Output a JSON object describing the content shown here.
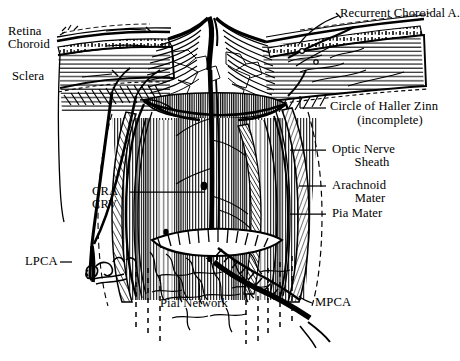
{
  "figure": {
    "style": "pen-and-ink anatomical illustration",
    "background_color": "#ffffff",
    "ink_color": "#000000",
    "signature": "artist signature (cursive monogram)"
  },
  "labels": {
    "retina": "Retina",
    "choroid": "Choroid",
    "sclera": "Sclera",
    "recurrent_choroidal_a": "Recurrent Choroidal A.",
    "circle_of_haller_zinn": "Circle of Haller Zinn",
    "circle_of_haller_zinn_note": "(incomplete)",
    "optic_nerve_sheath_l1": "Optic Nerve",
    "optic_nerve_sheath_l2": "Sheath",
    "arachnoid_mater_l1": "Arachnoid",
    "arachnoid_mater_l2": "Mater",
    "pia_mater": "Pia Mater",
    "cra": "CRA",
    "crv": "CRV",
    "lpca": "LPCA",
    "mpca": "MPCA",
    "pial_network": "Pial Network"
  },
  "structures": [
    {
      "name": "retina",
      "side": "left",
      "description": "inner neural layer at top of globe wall"
    },
    {
      "name": "choroid",
      "side": "left",
      "description": "vascular layer beneath retina"
    },
    {
      "name": "sclera",
      "side": "left",
      "description": "outer fibrous coat, horizontally striated"
    },
    {
      "name": "optic-nerve-head",
      "side": "center",
      "description": "optic disc with central cup"
    },
    {
      "name": "optic-nerve",
      "side": "center",
      "description": "vertically striated nerve trunk"
    },
    {
      "name": "optic-nerve-sheath",
      "side": "right",
      "description": "dural sheath investing the nerve"
    },
    {
      "name": "arachnoid-mater",
      "side": "right",
      "description": "middle meningeal layer"
    },
    {
      "name": "pia-mater",
      "side": "right",
      "description": "innermost meningeal layer"
    },
    {
      "name": "circle-of-haller-zinn",
      "side": "right",
      "description": "incomplete arterial circle around the nerve"
    },
    {
      "name": "recurrent-choroidal-artery",
      "side": "right",
      "description": "recurrent branch to choroid"
    },
    {
      "name": "central-retinal-artery-vein",
      "side": "center",
      "description": "CRA and CRV running in nerve axis"
    },
    {
      "name": "lateral-posterior-ciliary-artery",
      "side": "left",
      "description": "LPCA ascending at left"
    },
    {
      "name": "medial-posterior-ciliary-artery",
      "side": "right",
      "description": "MPCA entering at lower right"
    },
    {
      "name": "pial-network",
      "side": "center-bottom",
      "description": "reticular pial vascular plexus"
    }
  ],
  "leader_lines": [
    {
      "label": "retina",
      "from": [
        105,
        33
      ],
      "to": [
        150,
        30
      ]
    },
    {
      "label": "choroid",
      "from": [
        105,
        46
      ],
      "to": [
        150,
        46
      ]
    },
    {
      "label": "sclera",
      "from": [
        80,
        78
      ],
      "to": [
        118,
        74
      ]
    },
    {
      "label": "recurrent_choroidal_a",
      "from": [
        338,
        16
      ],
      "to": [
        300,
        45
      ]
    },
    {
      "label": "circle_of_haller_zinn",
      "from": [
        327,
        108
      ],
      "to": [
        300,
        108
      ]
    },
    {
      "label": "optic_nerve_sheath",
      "from": [
        327,
        150
      ],
      "to": [
        290,
        150
      ]
    },
    {
      "label": "arachnoid_mater",
      "from": [
        327,
        186
      ],
      "to": [
        298,
        186
      ]
    },
    {
      "label": "pia_mater",
      "from": [
        327,
        214
      ],
      "to": [
        290,
        214
      ]
    },
    {
      "label": "cra",
      "from": [
        128,
        192
      ],
      "to": [
        200,
        192
      ]
    },
    {
      "label": "lpca",
      "from": [
        58,
        262
      ],
      "to": [
        70,
        262
      ]
    },
    {
      "label": "mpca",
      "from": [
        310,
        303
      ],
      "to": [
        300,
        300
      ]
    },
    {
      "label": "pial_network",
      "from": [
        230,
        305
      ],
      "to": [
        245,
        300
      ]
    }
  ]
}
